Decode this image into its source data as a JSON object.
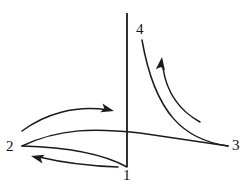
{
  "figure": {
    "kind": "state-transition-diagram",
    "background_color": "#ffffff",
    "stroke_color": "#1a1a1a",
    "label_color": "#111111",
    "width": 251,
    "height": 191,
    "axis": {
      "name": "vertical-axis",
      "x": 127,
      "y_top": 13,
      "y_bottom": 167
    },
    "labels": [
      {
        "id": "node-1",
        "text": "1",
        "x": 123,
        "y": 168
      },
      {
        "id": "node-2",
        "text": "2",
        "x": 6,
        "y": 139
      },
      {
        "id": "node-3",
        "text": "3",
        "x": 232,
        "y": 138
      },
      {
        "id": "node-4",
        "text": "4",
        "x": 136,
        "y": 22
      }
    ],
    "curves": [
      {
        "id": "curve-2-to-3",
        "name": "state-path-2-3",
        "has_arrow": false,
        "path": "M 22 146 C 60 128 95 128 140 133 C 180 139 208 143 228 146"
      },
      {
        "id": "curve-2-to-1",
        "name": "state-path-2-1",
        "has_arrow": false,
        "path": "M 22 146 C 60 147 100 152 127 167"
      },
      {
        "id": "curve-3-to-4",
        "name": "state-path-3-4",
        "has_arrow": false,
        "path": "M 228 146 C 185 140 155 115 142 40"
      },
      {
        "id": "arrow-curve-right",
        "name": "transition-arrow-rightward",
        "has_arrow": true,
        "direction": "right",
        "path": "M 22 131 C 45 114 75 105 108 110",
        "arrow_tip": {
          "x": 114,
          "y": 111
        },
        "arrow_angle_deg": 14
      },
      {
        "id": "arrow-curve-left",
        "name": "transition-arrow-leftward",
        "has_arrow": true,
        "direction": "left",
        "path": "M 118 167 C 90 166 60 162 39 157",
        "arrow_tip": {
          "x": 31,
          "y": 156
        },
        "arrow_angle_deg": 194
      },
      {
        "id": "arrow-curve-up",
        "name": "transition-arrow-upward",
        "has_arrow": true,
        "direction": "up",
        "path": "M 200 122 C 182 112 167 95 163 68",
        "arrow_tip": {
          "x": 162,
          "y": 57
        },
        "arrow_angle_deg": -83
      }
    ]
  }
}
